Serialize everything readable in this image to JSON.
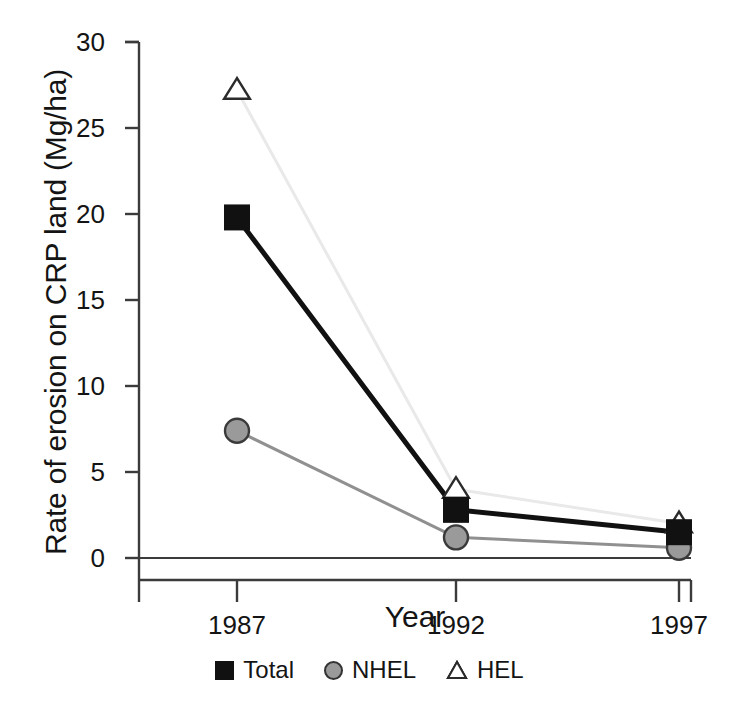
{
  "chart_data": {
    "type": "line",
    "title": "",
    "xlabel": "Year",
    "ylabel": "Rate of erosion on CRP land (Mg/ha)",
    "categories": [
      "1987",
      "1992",
      "1997"
    ],
    "x": [
      1987,
      1992,
      1997
    ],
    "xlim": [
      1985.8,
      1998.3
    ],
    "ylim": [
      0,
      30
    ],
    "yticks": [
      "0",
      "5",
      "10",
      "15",
      "20",
      "25",
      "30"
    ],
    "ytick_values": [
      0,
      5,
      10,
      15,
      20,
      25,
      30
    ],
    "xticks": [
      "1987",
      "1992",
      "1997"
    ],
    "grid": false,
    "legend_position": "bottom",
    "series": [
      {
        "name": "Total",
        "values": [
          19.8,
          2.8,
          1.5
        ],
        "marker": "square",
        "marker_fill": "#111111",
        "line_color": "#111111",
        "line_width": 5
      },
      {
        "name": "NHEL",
        "values": [
          7.4,
          1.2,
          0.6
        ],
        "marker": "circle",
        "marker_fill": "#9a9a9a",
        "line_color": "#909090",
        "line_width": 3
      },
      {
        "name": "HEL",
        "values": [
          27.2,
          4.0,
          2.0
        ],
        "marker": "triangle",
        "marker_fill": "#ffffff",
        "line_color": "#e9e9e9",
        "line_width": 3
      }
    ]
  },
  "axes": {
    "y_title": "Rate of erosion on CRP land (Mg/ha)",
    "x_title": "Year",
    "y_tick_labels": [
      "30",
      "25",
      "20",
      "15",
      "10",
      "5",
      "0"
    ],
    "x_tick_labels": [
      "1987",
      "1992",
      "1997"
    ],
    "axis_color": "#3b3b3b"
  },
  "legend": {
    "items": [
      {
        "label": "Total",
        "marker": "square-black"
      },
      {
        "label": "NHEL",
        "marker": "circle-gray"
      },
      {
        "label": "HEL",
        "marker": "triangle-white"
      }
    ]
  }
}
